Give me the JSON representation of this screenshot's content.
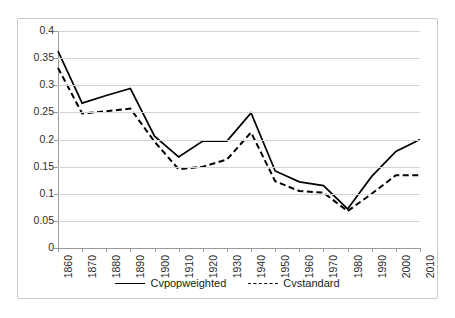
{
  "chart_data": {
    "type": "line",
    "title": "",
    "xlabel": "",
    "ylabel": "",
    "categories": [
      "1860",
      "1870",
      "1880",
      "1890",
      "1900",
      "1910",
      "1920",
      "1930",
      "1940",
      "1950",
      "1960",
      "1970",
      "1980",
      "1990",
      "2000",
      "2010"
    ],
    "ylim": [
      0,
      0.4
    ],
    "yticks": [
      "0",
      "0.05",
      "0.1",
      "0.15",
      "0.2",
      "0.25",
      "0.3",
      "0.35",
      "0.4"
    ],
    "ytick_values": [
      0,
      0.05,
      0.1,
      0.15,
      0.2,
      0.25,
      0.3,
      0.35,
      0.4
    ],
    "grid": true,
    "legend_position": "bottom",
    "series": [
      {
        "name": "Cvpopweighted",
        "style": "solid",
        "color": "#000000",
        "values": [
          0.363,
          0.267,
          0.281,
          0.294,
          0.206,
          0.168,
          0.197,
          0.197,
          0.249,
          0.142,
          0.122,
          0.115,
          0.072,
          0.132,
          0.178,
          0.2
        ]
      },
      {
        "name": "Cvstandard",
        "style": "dashed",
        "color": "#000000",
        "values": [
          0.332,
          0.248,
          0.252,
          0.257,
          0.196,
          0.145,
          0.15,
          0.163,
          0.213,
          0.123,
          0.105,
          0.102,
          0.068,
          0.1,
          0.134,
          0.134
        ]
      }
    ]
  },
  "legend": {
    "items": [
      {
        "label": "Cvpopweighted",
        "style": "solid"
      },
      {
        "label": "Cvstandard",
        "style": "dashed"
      }
    ]
  }
}
